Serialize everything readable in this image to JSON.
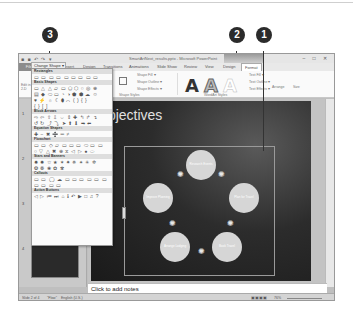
{
  "callouts": [
    {
      "number": "3",
      "target": "change-shape-button"
    },
    {
      "number": "2",
      "target": "tab-format"
    },
    {
      "number": "1",
      "target": "smartart-graphic"
    }
  ],
  "window": {
    "title": "SmartArtNext_results.pptx - Microsoft PowerPoint",
    "quick_access": "■ ■ ↶ ↷ ▾",
    "window_buttons": "– □ ✕"
  },
  "tabs": [
    {
      "label": "File"
    },
    {
      "label": "Home"
    },
    {
      "label": "Insert"
    },
    {
      "label": "Design"
    },
    {
      "label": "Transitions"
    },
    {
      "label": "Animations"
    },
    {
      "label": "Slide Show"
    },
    {
      "label": "Review"
    },
    {
      "label": "View"
    },
    {
      "label": "Design"
    },
    {
      "label": "Format"
    }
  ],
  "ribbon": {
    "change_shape": "Change Shape ▾",
    "shape_fill": "Shape Fill ▾",
    "shape_outline": "Shape Outline ▾",
    "shape_effects": "Shape Effects ▾",
    "text_fill": "Text Fill ▾",
    "text_outline": "Text Outline ▾",
    "text_effects": "Text Effects ▾",
    "arrange": "Arrange",
    "size": "Size",
    "group_shape_styles": "Shape Styles",
    "group_wordart_styles": "WordArt Styles",
    "edit_in_2d": "Edit in 2-D"
  },
  "gallery": {
    "categories": [
      {
        "name": "Rectangles",
        "rows": [
          "▭ ▭ ▭ ▭ ▭ ▭ ▭ ▭ ▭"
        ]
      },
      {
        "name": "Basic Shapes",
        "rows": [
          "▭ △ △ ▱ ▭ ⬠ ⬡ ○ ◎ ⊕",
          "▤ ◆ ⬭ ▭ ◔ ◑ ⬟ ⬢ ☁ ☺",
          "♥ ⚡ ☼ ☾ ⬮ ⌒ ( ) { }",
          "{ } [ ]"
        ]
      },
      {
        "name": "Block Arrows",
        "rows": [
          "⇨ ⇦ ⇧ ⇩ ⇔ ⇕ ✚ ↰ ↱ ↴",
          "↺ ↻ ⤴ ⤵ ➤ ⬆ ⬇ ➡ ⬅"
        ]
      },
      {
        "name": "Equation Shapes",
        "rows": [
          "✚ − ✖ ➗ ═ ≠"
        ]
      },
      {
        "name": "Flowchart",
        "rows": [
          "▭ ▭ ◇ ▱ ▭ ▭ ▭ ⬭ ▭ ▭",
          "○ ▽ △ ✖ ⊕ ⧖ ◁ ▷ ● ⬭"
        ]
      },
      {
        "name": "Stars and Banners",
        "rows": [
          "✸ ✹ ☆ ★ ✶ ✷ ✵ ✴ ✳ ✲",
          "❂ ❁ ❀ ✿ ✾"
        ]
      },
      {
        "name": "Callouts",
        "rows": [
          "▭ ▭ ◯ ☁ ▭ ▭ ▭ ▭ ▭ ▭",
          "▭ ▭ ▭ ▭"
        ]
      },
      {
        "name": "Action Buttons",
        "rows": [
          "◁ ▷ ⏮ ⏭ ⌂ ℹ ↶ ▶ □ ♫ ?"
        ]
      }
    ]
  },
  "slide": {
    "title": "Objectives",
    "smartart_nodes": [
      {
        "label": "Research Events"
      },
      {
        "label": "Plan for Travel"
      },
      {
        "label": "Book Travel"
      },
      {
        "label": "Arrange Lodging"
      },
      {
        "label": "Improve Planning"
      }
    ]
  },
  "slides_panel": {
    "thumbnails": [
      {
        "number": "1"
      },
      {
        "number": "2"
      },
      {
        "number": "3"
      },
      {
        "number": "4"
      }
    ]
  },
  "notes": {
    "placeholder": "Click to add notes"
  },
  "statusbar": {
    "slide_info": "Slide 2 of 4",
    "theme": "\"Flow\"",
    "language": "English (U.S.)",
    "zoom": "76%"
  }
}
